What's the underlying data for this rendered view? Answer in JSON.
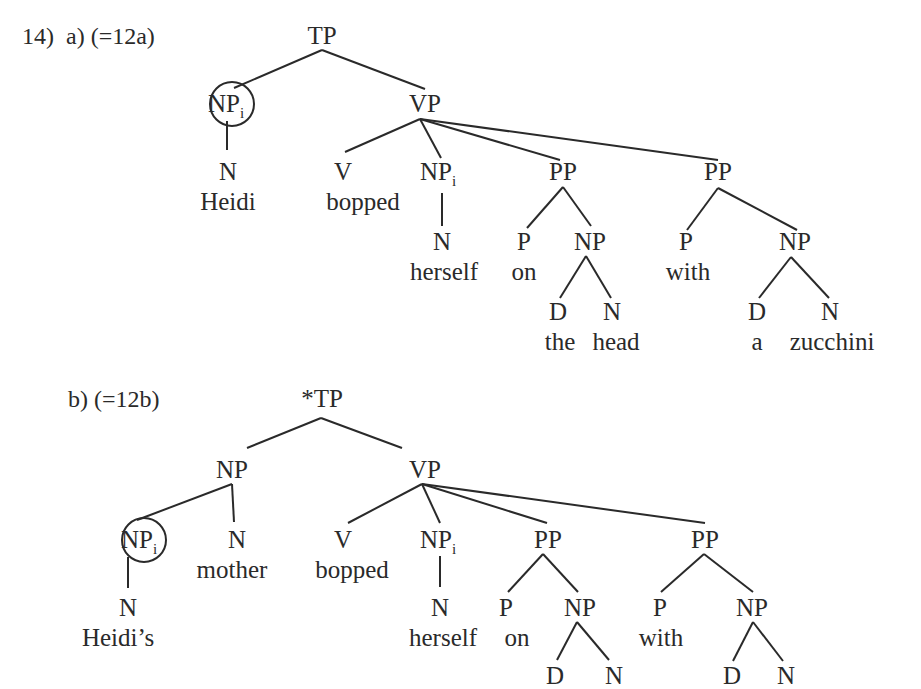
{
  "cut_off_text": "",
  "example_number": "14)",
  "trees": [
    {
      "label": "a) (=12a)",
      "root": "TP",
      "nodes": {
        "subject_np": {
          "cat": "NP",
          "index": "i",
          "circled": true
        },
        "subject_n": "N",
        "subject_word": "Heidi",
        "vp": "VP",
        "v": "V",
        "v_word": "bopped",
        "obj_np": {
          "cat": "NP",
          "index": "i"
        },
        "obj_n": "N",
        "obj_word": "herself",
        "pp1": "PP",
        "pp1_p": "P",
        "pp1_p_word": "on",
        "pp1_np": "NP",
        "pp1_d": "D",
        "pp1_n": "N",
        "pp1_d_word": "the",
        "pp1_n_word": "head",
        "pp2": "PP",
        "pp2_p": "P",
        "pp2_p_word": "with",
        "pp2_np": "NP",
        "pp2_d": "D",
        "pp2_n": "N",
        "pp2_d_word": "a",
        "pp2_n_word": "zucchini"
      }
    },
    {
      "label": "b) (=12b)",
      "root": "*TP",
      "nodes": {
        "subject_np": "NP",
        "poss_np": {
          "cat": "NP",
          "index": "i",
          "circled": true
        },
        "poss_n": "N",
        "poss_word": "Heidi’s",
        "head_n": "N",
        "head_word": "mother",
        "vp": "VP",
        "v": "V",
        "v_word": "bopped",
        "obj_np": {
          "cat": "NP",
          "index": "i"
        },
        "obj_n": "N",
        "obj_word": "herself",
        "pp1": "PP",
        "pp1_p": "P",
        "pp1_p_word": "on",
        "pp1_np": "NP",
        "pp1_d": "D",
        "pp1_n": "N",
        "pp2": "PP",
        "pp2_p": "P",
        "pp2_p_word": "with",
        "pp2_np": "NP",
        "pp2_d": "D",
        "pp2_n": "N"
      }
    }
  ]
}
